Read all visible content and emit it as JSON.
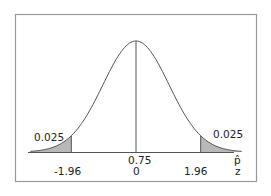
{
  "chart_data": {
    "type": "area",
    "title": "",
    "xlabel_top": "p̂",
    "xlabel_bottom": "z",
    "center": {
      "phat": "0.75",
      "z": "0"
    },
    "critical_values": [
      {
        "z": "-1.96",
        "tail_area": "0.025",
        "side": "left"
      },
      {
        "z": "1.96",
        "tail_area": "0.025",
        "side": "right"
      }
    ],
    "x_range": [
      -3.2,
      3.2
    ],
    "grid": false,
    "legend": null
  },
  "labels": {
    "left_tail": "0.025",
    "right_tail": "0.025",
    "left_crit": "-1.96",
    "right_crit": "1.96",
    "center_phat": "0.75",
    "center_z": "0",
    "axis_phat": "p̂",
    "axis_z": "z"
  },
  "colors": {
    "curve": "#555555",
    "shade": "#b8b8b8",
    "frame": "#9a9a9a",
    "axis": "#555555"
  }
}
